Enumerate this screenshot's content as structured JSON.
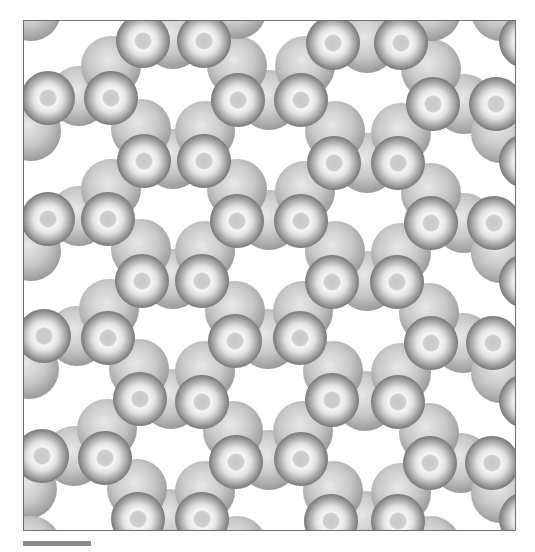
{
  "figure": {
    "frame": {
      "x": 23,
      "y": 20,
      "width": 493,
      "height": 511,
      "border_color": "#6f6f6f"
    },
    "colors": {
      "background": "#ffffff",
      "sphere_highlight": "#f4f4f4",
      "sphere_mid": "#c4c4c4",
      "sphere_edge": "#7a7a7a",
      "core_dot": "#b8b8b8",
      "back_sphere": "#bdbdbd"
    },
    "front_radius": 27,
    "back_radius": 30,
    "front_spheres": [
      [
        142,
        40
      ],
      [
        203,
        40
      ],
      [
        332,
        42
      ],
      [
        400,
        42
      ],
      [
        47,
        97
      ],
      [
        110,
        97
      ],
      [
        237,
        99
      ],
      [
        300,
        99
      ],
      [
        432,
        103
      ],
      [
        495,
        103
      ],
      [
        143,
        160
      ],
      [
        203,
        160
      ],
      [
        333,
        162
      ],
      [
        397,
        162
      ],
      [
        47,
        218
      ],
      [
        107,
        218
      ],
      [
        236,
        220
      ],
      [
        300,
        220
      ],
      [
        430,
        222
      ],
      [
        493,
        222
      ],
      [
        141,
        280
      ],
      [
        201,
        280
      ],
      [
        331,
        281
      ],
      [
        396,
        281
      ],
      [
        43,
        335
      ],
      [
        107,
        337
      ],
      [
        234,
        340
      ],
      [
        299,
        337
      ],
      [
        430,
        342
      ],
      [
        492,
        342
      ],
      [
        139,
        398
      ],
      [
        201,
        401
      ],
      [
        331,
        399
      ],
      [
        397,
        401
      ],
      [
        41,
        455
      ],
      [
        104,
        457
      ],
      [
        235,
        461
      ],
      [
        300,
        458
      ],
      [
        429,
        462
      ],
      [
        491,
        462
      ],
      [
        137,
        518
      ],
      [
        201,
        518
      ],
      [
        330,
        520
      ],
      [
        397,
        520
      ],
      [
        -16,
        40
      ],
      [
        -16,
        160
      ],
      [
        -16,
        280
      ],
      [
        -16,
        400
      ],
      [
        -16,
        518
      ],
      [
        525,
        40
      ],
      [
        525,
        160
      ],
      [
        525,
        280
      ],
      [
        525,
        400
      ],
      [
        525,
        518
      ]
    ],
    "back_spheres": [
      [
        172,
        38
      ],
      [
        366,
        42
      ],
      [
        78,
        95
      ],
      [
        268,
        99
      ],
      [
        463,
        103
      ],
      [
        172,
        158
      ],
      [
        366,
        162
      ],
      [
        78,
        215
      ],
      [
        268,
        219
      ],
      [
        463,
        222
      ],
      [
        172,
        278
      ],
      [
        366,
        280
      ],
      [
        76,
        335
      ],
      [
        267,
        338
      ],
      [
        462,
        342
      ],
      [
        170,
        398
      ],
      [
        364,
        400
      ],
      [
        73,
        455
      ],
      [
        268,
        459
      ],
      [
        460,
        462
      ],
      [
        168,
        518
      ],
      [
        364,
        520
      ],
      [
        110,
        65
      ],
      [
        236,
        65
      ],
      [
        304,
        65
      ],
      [
        430,
        68
      ],
      [
        30,
        130
      ],
      [
        140,
        128
      ],
      [
        204,
        130
      ],
      [
        334,
        130
      ],
      [
        400,
        132
      ],
      [
        500,
        132
      ],
      [
        110,
        188
      ],
      [
        236,
        188
      ],
      [
        304,
        190
      ],
      [
        430,
        192
      ],
      [
        30,
        250
      ],
      [
        140,
        248
      ],
      [
        204,
        250
      ],
      [
        334,
        250
      ],
      [
        400,
        252
      ],
      [
        500,
        252
      ],
      [
        108,
        308
      ],
      [
        234,
        310
      ],
      [
        302,
        310
      ],
      [
        428,
        312
      ],
      [
        28,
        368
      ],
      [
        138,
        368
      ],
      [
        204,
        370
      ],
      [
        332,
        370
      ],
      [
        400,
        372
      ],
      [
        500,
        372
      ],
      [
        106,
        428
      ],
      [
        232,
        430
      ],
      [
        302,
        430
      ],
      [
        428,
        432
      ],
      [
        26,
        488
      ],
      [
        136,
        488
      ],
      [
        204,
        490
      ],
      [
        332,
        490
      ],
      [
        400,
        492
      ],
      [
        500,
        492
      ],
      [
        10,
        8
      ],
      [
        236,
        8
      ],
      [
        430,
        10
      ],
      [
        30,
        10
      ],
      [
        500,
        10
      ],
      [
        236,
        545
      ],
      [
        430,
        545
      ],
      [
        30,
        545
      ]
    ]
  },
  "scale_bar": {
    "x": 23,
    "y": 541,
    "width": 68,
    "height": 5,
    "color": "#8a8a8a"
  },
  "caption": {
    "text": ""
  }
}
